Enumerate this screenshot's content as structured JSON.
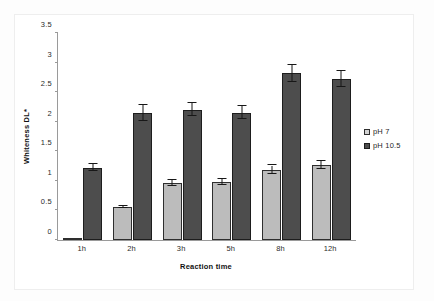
{
  "chart_data": {
    "type": "bar",
    "title": "",
    "xlabel": "Reaction time",
    "ylabel": "Whiteness DL*",
    "categories": [
      "1h",
      "2h",
      "3h",
      "5h",
      "8h",
      "12h"
    ],
    "ylim": [
      0,
      3.5
    ],
    "yticks": [
      "0",
      "0.5",
      "1",
      "1.5",
      "2",
      "2.5",
      "3",
      "3.5"
    ],
    "ytick_values": [
      0,
      0.5,
      1,
      1.5,
      2,
      2.5,
      3,
      3.5
    ],
    "grid": false,
    "legend_position": "right",
    "series": [
      {
        "name": "pH 7",
        "color": "#bcbcbc",
        "values": [
          0.01,
          0.56,
          0.96,
          0.98,
          1.19,
          1.27
        ],
        "errors": [
          0.0,
          0.02,
          0.05,
          0.05,
          0.07,
          0.07
        ]
      },
      {
        "name": "pH 10.5",
        "color": "#4d4d4d",
        "values": [
          1.22,
          2.15,
          2.2,
          2.15,
          2.82,
          2.72
        ],
        "errors": [
          0.06,
          0.13,
          0.11,
          0.11,
          0.14,
          0.14
        ]
      }
    ]
  },
  "legend": {
    "items": [
      {
        "label": "pH 7"
      },
      {
        "label": "pH 10.5"
      }
    ]
  }
}
